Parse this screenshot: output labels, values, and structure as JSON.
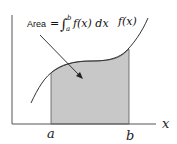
{
  "diagram": {
    "annotation": {
      "prefix": "Area",
      "equals": "=",
      "integral": "∫",
      "upper": "b",
      "lower": "a",
      "integrand": "f(x) dx"
    },
    "curve_label": "f(x)",
    "x_axis_label": "x",
    "lower_bound_label": "a",
    "upper_bound_label": "b",
    "colors": {
      "shade": "#c8c8c8",
      "axis": "#444444",
      "curve": "#333333"
    }
  }
}
